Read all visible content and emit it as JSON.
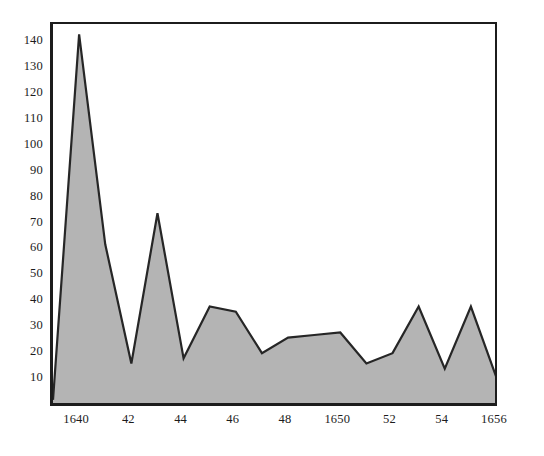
{
  "chart_data": {
    "type": "area",
    "title": "NUMBER OF TOWN ORDERS",
    "xlabel": "",
    "ylabel": "",
    "grid": false,
    "legend": "none",
    "fill_color": "#b4b4b4",
    "line_color": "#262626",
    "axis_color": "#1c1c1c",
    "background_color": "#ffffff",
    "xlim": [
      1639,
      1656
    ],
    "ylim": [
      0,
      147
    ],
    "x": [
      1639,
      1640,
      1641,
      1642,
      1643,
      1644,
      1645,
      1646,
      1647,
      1648,
      1649,
      1650,
      1651,
      1652,
      1653,
      1654,
      1655,
      1656
    ],
    "values": [
      2,
      143,
      62,
      16,
      74,
      18,
      38,
      36,
      20,
      26,
      27,
      28,
      16,
      20,
      38,
      14,
      38,
      10
    ],
    "x_tick_values": [
      1640,
      1642,
      1644,
      1646,
      1648,
      1650,
      1652,
      1654,
      1656
    ],
    "x_tick_labels": [
      "1640",
      "42",
      "44",
      "46",
      "48",
      "1650",
      "52",
      "54",
      "1656"
    ],
    "y_tick_values": [
      10,
      20,
      30,
      40,
      50,
      60,
      70,
      80,
      90,
      100,
      110,
      120,
      130,
      140
    ],
    "y_tick_labels": [
      "10",
      "20",
      "30",
      "40",
      "50",
      "60",
      "70",
      "80",
      "90",
      "100",
      "110",
      "120",
      "130",
      "140"
    ]
  }
}
